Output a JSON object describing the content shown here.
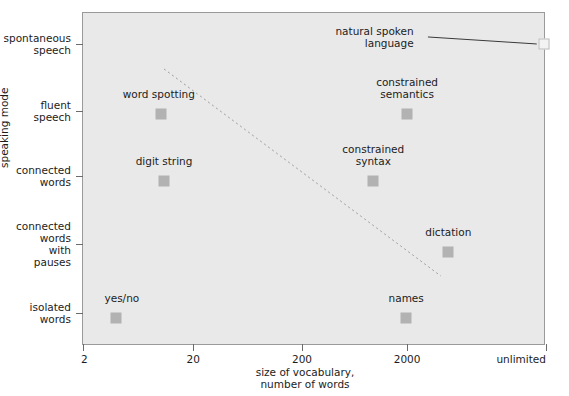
{
  "chart_data": {
    "type": "scatter",
    "title": "",
    "xlabel": "size of vocabulary,\nnumber of words",
    "ylabel": "speaking mode",
    "x_tick_labels": [
      "2",
      "20",
      "200",
      "2000",
      "unlimited"
    ],
    "x_tick_fracs": [
      0.0,
      0.238,
      0.473,
      0.7,
      1.0
    ],
    "y_tick_labels": [
      "spontaneous\nspeech",
      "fluent\nspeech",
      "connected\nwords",
      "connected\nwords\nwith\npauses",
      "isolated\nwords"
    ],
    "y_tick_fracs": [
      0.093,
      0.295,
      0.49,
      0.694,
      0.901
    ],
    "grid": false,
    "legend": null,
    "background": "#e9e9e9",
    "marker_color": "#b2b2b2",
    "points": [
      {
        "label": "yes/no",
        "x_frac": 0.071,
        "y_frac": 0.916,
        "label_dx": 6,
        "label_dy": -9,
        "open": false
      },
      {
        "label": "digit string",
        "x_frac": 0.175,
        "y_frac": 0.505,
        "label_dx": 0,
        "label_dy": -9,
        "open": false
      },
      {
        "label": "word spotting",
        "x_frac": 0.168,
        "y_frac": 0.303,
        "label_dx": -2,
        "label_dy": -9,
        "open": false
      },
      {
        "label": "constrained\nsyntax",
        "x_frac": 0.627,
        "y_frac": 0.505,
        "label_dx": 0,
        "label_dy": -9,
        "open": false
      },
      {
        "label": "constrained\nsemantics",
        "x_frac": 0.7,
        "y_frac": 0.303,
        "label_dx": 0,
        "label_dy": -9,
        "open": false
      },
      {
        "label": "names",
        "x_frac": 0.698,
        "y_frac": 0.916,
        "label_dx": 0,
        "label_dy": -9,
        "open": false
      },
      {
        "label": "dictation",
        "x_frac": 0.789,
        "y_frac": 0.718,
        "label_dx": 0,
        "label_dy": -9,
        "open": false
      },
      {
        "label": "natural spoken\nlanguage",
        "x_frac": 0.995,
        "y_frac": 0.093,
        "label_dx": -130,
        "label_dy": -2,
        "open": true
      }
    ],
    "trend_line": {
      "style": "dotted",
      "color": "#9c9c9c",
      "x1_frac": 0.175,
      "y1_frac": 0.168,
      "x2_frac": 0.773,
      "y2_frac": 0.79
    },
    "leader_line": {
      "color": "#3a3a3a",
      "x1_frac": 0.745,
      "y1_frac": 0.072,
      "x2_frac": 0.98,
      "y2_frac": 0.093
    }
  }
}
